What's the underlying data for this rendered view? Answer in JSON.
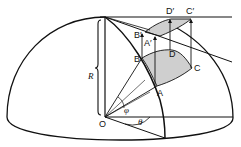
{
  "diagram": {
    "labels": {
      "R": "R",
      "O": "O",
      "A": "A",
      "B": "B",
      "C": "C",
      "D": "D",
      "A_prime": "A′",
      "B_prime": "B′",
      "C_prime": "C′",
      "D_prime": "D′",
      "phi": "φ",
      "theta": "θ"
    },
    "colors": {
      "stroke": "#111111",
      "shaded_patch": "#cfcfcf",
      "background": "#ffffff"
    }
  }
}
